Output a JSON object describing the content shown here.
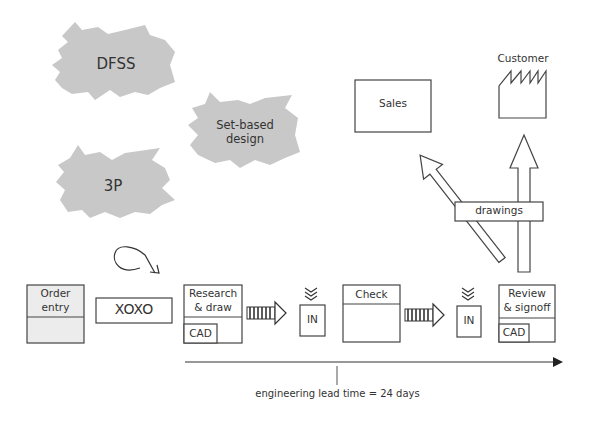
{
  "bursts": [
    {
      "label": "DFSS"
    },
    {
      "label": "Set-based design",
      "line1": "Set-based",
      "line2": "design"
    },
    {
      "label": "3P"
    }
  ],
  "entities": {
    "sales": {
      "label": "Sales"
    },
    "customer": {
      "label": "Customer"
    }
  },
  "info_flow": {
    "label": "drawings"
  },
  "process": {
    "order_entry": {
      "line1": "Order",
      "line2": "entry"
    },
    "kaizen_loop": {
      "label": "XOXO"
    },
    "research_draw": {
      "line1": "Research",
      "line2": "& draw",
      "tool": "CAD"
    },
    "inbox1": {
      "label": "IN"
    },
    "check": {
      "label": "Check"
    },
    "inbox2": {
      "label": "IN"
    },
    "review_signoff": {
      "line1": "Review",
      "line2": "& signoff",
      "tool": "CAD"
    }
  },
  "timeline": {
    "label": "engineering lead time = 24 days"
  },
  "colors": {
    "burst_fill": "#c8c8c8",
    "box_fill": "#ececec",
    "stroke": "#444444"
  }
}
